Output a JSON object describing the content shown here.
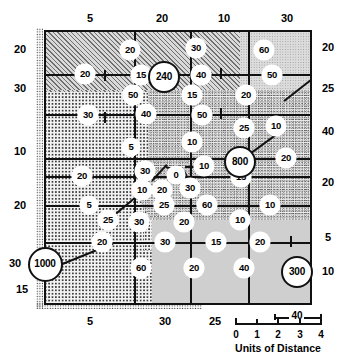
{
  "figure": {
    "type": "thematic-map"
  },
  "axes": {
    "top_labels": [
      "5",
      "20",
      "10",
      "30"
    ],
    "bottom_labels": [
      "5",
      "30",
      "25"
    ],
    "left_labels": [
      "20",
      "30",
      "10",
      "20",
      "30",
      "15"
    ],
    "right_labels": [
      "20",
      "25",
      "40",
      "20",
      "5",
      "10"
    ]
  },
  "scale_bar": {
    "numbers": [
      "0",
      "1",
      "2",
      "3",
      "4"
    ],
    "caption": "Units of Distance",
    "segment_label": "40"
  },
  "cities": [
    {
      "label": "240",
      "name": "city-240"
    },
    {
      "label": "800",
      "name": "city-800"
    },
    {
      "label": "1000",
      "name": "city-1000"
    },
    {
      "label": "300",
      "name": "city-300"
    }
  ],
  "link_values": [
    "20",
    "30",
    "60",
    "20",
    "15",
    "40",
    "50",
    "50",
    "15",
    "20",
    "30",
    "40",
    "50",
    "25",
    "10",
    "5",
    "10",
    "20",
    "20",
    "30",
    "0",
    "10",
    "10",
    "20",
    "30",
    "15",
    "5",
    "25",
    "60",
    "10",
    "25",
    "30",
    "20",
    "10",
    "20",
    "30",
    "15",
    "20",
    "60",
    "20",
    "40"
  ],
  "chart_data": {
    "type": "map",
    "title": "",
    "xlabel": "Units of Distance",
    "ylabel": "",
    "legend": "none",
    "grid": true,
    "nodes": [
      {
        "label": "1000",
        "x": 0,
        "y": 232,
        "kind": "city"
      },
      {
        "label": "240",
        "x": 118,
        "y": 45,
        "kind": "city"
      },
      {
        "label": "800",
        "x": 194,
        "y": 130,
        "kind": "city"
      },
      {
        "label": "300",
        "x": 251,
        "y": 240,
        "kind": "city"
      }
    ],
    "edge_labels": [
      {
        "label": "20",
        "x": 86,
        "y": 20
      },
      {
        "label": "30",
        "x": 152,
        "y": 18
      },
      {
        "label": "60",
        "x": 220,
        "y": 20
      },
      {
        "label": "20",
        "x": 41,
        "y": 44
      },
      {
        "label": "15",
        "x": 97,
        "y": 45
      },
      {
        "label": "40",
        "x": 157,
        "y": 45
      },
      {
        "label": "50",
        "x": 228,
        "y": 45
      },
      {
        "label": "50",
        "x": 89,
        "y": 65
      },
      {
        "label": "15",
        "x": 148,
        "y": 65
      },
      {
        "label": "20",
        "x": 202,
        "y": 65
      },
      {
        "label": "30",
        "x": 44,
        "y": 85
      },
      {
        "label": "40",
        "x": 102,
        "y": 84
      },
      {
        "label": "50",
        "x": 158,
        "y": 85
      },
      {
        "label": "25",
        "x": 200,
        "y": 98
      },
      {
        "label": "10",
        "x": 232,
        "y": 96
      },
      {
        "label": "5",
        "x": 87,
        "y": 117
      },
      {
        "label": "10",
        "x": 148,
        "y": 112
      },
      {
        "label": "20",
        "x": 242,
        "y": 128
      },
      {
        "label": "20",
        "x": 38,
        "y": 146
      },
      {
        "label": "30",
        "x": 101,
        "y": 141
      },
      {
        "label": "0",
        "x": 132,
        "y": 145
      },
      {
        "label": "10",
        "x": 160,
        "y": 136
      },
      {
        "label": "10",
        "x": 98,
        "y": 160
      },
      {
        "label": "20",
        "x": 118,
        "y": 160
      },
      {
        "label": "30",
        "x": 146,
        "y": 158
      },
      {
        "label": "15",
        "x": 197,
        "y": 147
      },
      {
        "label": "5",
        "x": 45,
        "y": 175
      },
      {
        "label": "25",
        "x": 120,
        "y": 175
      },
      {
        "label": "60",
        "x": 163,
        "y": 175
      },
      {
        "label": "10",
        "x": 226,
        "y": 175
      },
      {
        "label": "25",
        "x": 64,
        "y": 190
      },
      {
        "label": "30",
        "x": 95,
        "y": 192
      },
      {
        "label": "20",
        "x": 140,
        "y": 192
      },
      {
        "label": "10",
        "x": 196,
        "y": 190
      },
      {
        "label": "20",
        "x": 58,
        "y": 212
      },
      {
        "label": "30",
        "x": 121,
        "y": 212
      },
      {
        "label": "15",
        "x": 172,
        "y": 212
      },
      {
        "label": "20",
        "x": 216,
        "y": 212
      },
      {
        "label": "60",
        "x": 97,
        "y": 238
      },
      {
        "label": "20",
        "x": 150,
        "y": 238
      },
      {
        "label": "40",
        "x": 200,
        "y": 238
      }
    ]
  }
}
